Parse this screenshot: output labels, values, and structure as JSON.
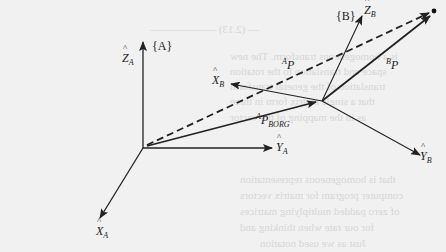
{
  "figure": {
    "type": "coordinate-frame-diagram",
    "frames": [
      {
        "name": "{A}",
        "axes": {
          "z": "Z",
          "y": "Y",
          "x": "X"
        },
        "subscript": "A"
      },
      {
        "name": "{B}",
        "axes": {
          "z": "Z",
          "y": "Y",
          "x": "X"
        },
        "subscript": "B"
      }
    ],
    "labels": {
      "frame_a": "{A}",
      "frame_b": "{B}",
      "z_a": "Z",
      "z_a_sub": "A",
      "y_a": "Y",
      "y_a_sub": "A",
      "x_a": "X",
      "x_a_sub": "A",
      "z_b": "Z",
      "z_b_sub": "B",
      "y_b": "Y",
      "y_b_sub": "B",
      "x_b": "X",
      "x_b_sub": "B",
      "ap_sup": "A",
      "ap": "P",
      "bp_sup": "B",
      "bp": "P",
      "aporg_sup": "A",
      "aporg": "P",
      "aporg_sub": "BORG"
    },
    "vectors": [
      {
        "name": "AP",
        "from": "A origin",
        "to": "point P",
        "style": "dashed"
      },
      {
        "name": "BP",
        "from": "B origin",
        "to": "point P",
        "style": "solid"
      },
      {
        "name": "AP_BORG",
        "from": "A origin",
        "to": "B origin",
        "style": "solid"
      }
    ],
    "colors": {
      "ink": "#222222",
      "paper": "#f1f1f1",
      "bleed_text": "#d6d6d6"
    }
  }
}
